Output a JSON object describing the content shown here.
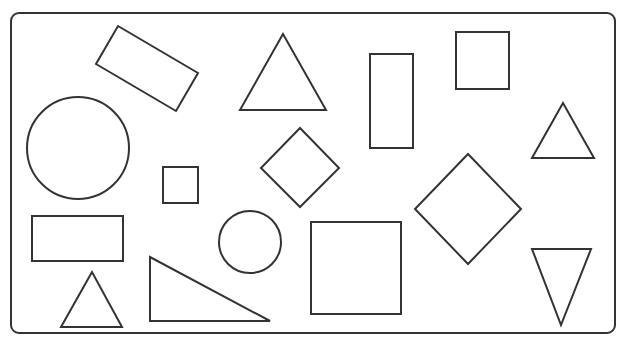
{
  "diagram": {
    "title": "",
    "stroke_color": "#333333",
    "background": "#ffffff",
    "stroke_width": 2,
    "frame": {
      "x": 11,
      "y": 13,
      "width": 604,
      "height": 320,
      "rx": 8
    },
    "shapes": [
      {
        "id": "rotated-rectangle",
        "type": "polygon",
        "points": "118,26 198,73 176,111 96,64"
      },
      {
        "id": "triangle-top-center",
        "type": "polygon",
        "points": "283,34 240,110 326,110"
      },
      {
        "id": "tall-rectangle",
        "type": "rect",
        "x": 370,
        "y": 54,
        "width": 43,
        "height": 94
      },
      {
        "id": "square-top-right",
        "type": "rect",
        "x": 456,
        "y": 32,
        "width": 53,
        "height": 57
      },
      {
        "id": "triangle-right",
        "type": "polygon",
        "points": "563,103 532,158 594,158"
      },
      {
        "id": "large-circle",
        "type": "circle",
        "cx": 78,
        "cy": 148,
        "r": 51
      },
      {
        "id": "small-square",
        "type": "rect",
        "x": 163,
        "y": 167,
        "width": 35,
        "height": 36
      },
      {
        "id": "diamond-center",
        "type": "polygon",
        "points": "300,128 339,168 300,207 261,168"
      },
      {
        "id": "diamond-right",
        "type": "polygon",
        "points": "468,154 521,209 468,264 415,209"
      },
      {
        "id": "wide-rectangle",
        "type": "rect",
        "x": 32,
        "y": 216,
        "width": 91,
        "height": 45
      },
      {
        "id": "small-circle",
        "type": "circle",
        "cx": 250,
        "cy": 242,
        "r": 31
      },
      {
        "id": "large-square",
        "type": "rect",
        "x": 311,
        "y": 222,
        "width": 90,
        "height": 92
      },
      {
        "id": "inverted-triangle",
        "type": "polygon",
        "points": "532,249 591,249 561,325"
      },
      {
        "id": "small-triangle",
        "type": "polygon",
        "points": "92,272 61,327 122,327"
      },
      {
        "id": "right-triangle",
        "type": "polygon",
        "points": "150,257 150,321 270,321"
      }
    ]
  }
}
